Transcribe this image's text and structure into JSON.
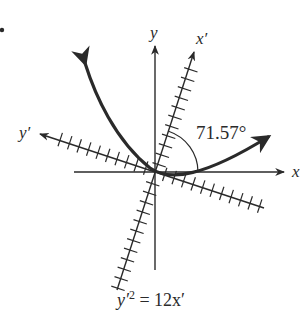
{
  "figure": {
    "axes": {
      "x_label": "x",
      "y_label": "y",
      "x_prime_label": "x′",
      "y_prime_label": "y′"
    },
    "angle_label": "71.57°",
    "caption": {
      "lhs": "y′",
      "exp": "2",
      "rhs": " = 12x′"
    },
    "colors": {
      "ink": "#2a2a2a",
      "background": "#ffffff"
    },
    "rotation_degrees": 71.57,
    "equation": "y'^2 = 12x'"
  }
}
